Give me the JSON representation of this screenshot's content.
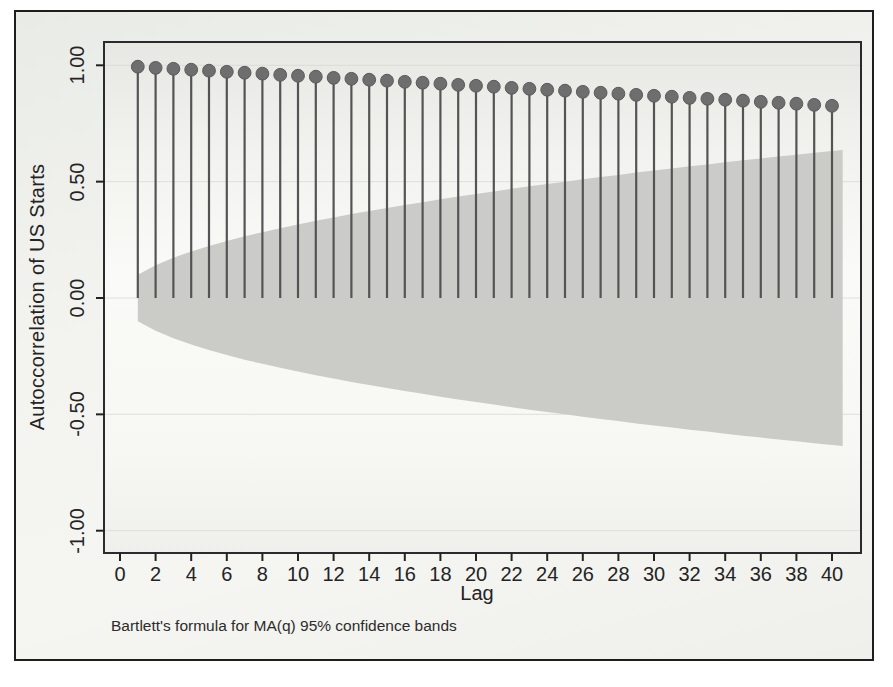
{
  "figure": {
    "y_axis_title": "Autoccorrelation of US Starts",
    "x_axis_title": "Lag",
    "note": "Bartlett's formula for MA(q) 95% confidence bands"
  },
  "colors": {
    "outer_border": "#1e1e1e",
    "figure_background": "#f0f1ed",
    "plot_background_top": "#e7e8e4",
    "plot_background_mid": "#fafaf8",
    "plot_background_bottom": "#efefeb",
    "plot_frame": "#2b2b2b",
    "gridline": "#d9d9d2",
    "confidence_band": "#cbccc8",
    "stem": "#545454",
    "dot": "#6e6e6e",
    "text": "#242424"
  },
  "chart_data": {
    "type": "bar",
    "subtype": "lollipop-autocorrelogram",
    "title": "",
    "xlabel": "Lag",
    "ylabel": "Autoccorrelation of US Starts",
    "note": "Bartlett's formula for MA(q) 95% confidence bands",
    "legend": [],
    "grid": "faint horizontal lines at y ticks",
    "xlim": [
      -1.0,
      42.2
    ],
    "ylim": [
      -1.1,
      1.1
    ],
    "xticks": [
      0,
      2,
      4,
      6,
      8,
      10,
      12,
      14,
      16,
      18,
      20,
      22,
      24,
      26,
      28,
      30,
      32,
      34,
      36,
      38,
      40
    ],
    "ytick_values": [
      1.0,
      0.5,
      0.0,
      -0.5,
      -1.0
    ],
    "ytick_labels": [
      "1.00",
      "0.50",
      "0.00",
      "-0.50",
      "-1.00"
    ],
    "lags": [
      1,
      2,
      3,
      4,
      5,
      6,
      7,
      8,
      9,
      10,
      11,
      12,
      13,
      14,
      15,
      16,
      17,
      18,
      19,
      20,
      21,
      22,
      23,
      24,
      25,
      26,
      27,
      28,
      29,
      30,
      31,
      32,
      33,
      34,
      35,
      36,
      37,
      38,
      39,
      40
    ],
    "acf": [
      0.994,
      0.989,
      0.985,
      0.981,
      0.977,
      0.972,
      0.968,
      0.964,
      0.959,
      0.955,
      0.951,
      0.946,
      0.942,
      0.938,
      0.934,
      0.929,
      0.925,
      0.921,
      0.916,
      0.912,
      0.908,
      0.903,
      0.899,
      0.895,
      0.891,
      0.886,
      0.882,
      0.878,
      0.873,
      0.869,
      0.865,
      0.86,
      0.856,
      0.852,
      0.848,
      0.843,
      0.839,
      0.835,
      0.83,
      0.826
    ],
    "band_halfwidth": [
      0.1,
      0.141,
      0.173,
      0.2,
      0.224,
      0.245,
      0.265,
      0.283,
      0.3,
      0.316,
      0.332,
      0.346,
      0.361,
      0.374,
      0.387,
      0.4,
      0.412,
      0.424,
      0.436,
      0.447,
      0.458,
      0.469,
      0.48,
      0.49,
      0.5,
      0.51,
      0.52,
      0.529,
      0.539,
      0.548,
      0.557,
      0.566,
      0.574,
      0.583,
      0.592,
      0.6,
      0.608,
      0.616,
      0.624,
      0.632
    ],
    "band_meaning": "95% confidence band for MA(q), Bartlett's formula, symmetric around 0"
  }
}
